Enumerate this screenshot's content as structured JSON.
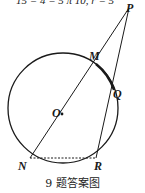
{
  "header": {
    "clipped_text": "15 = 4 = 5 π 10, r = 5"
  },
  "diagram": {
    "points": {
      "P": "P",
      "M": "M",
      "Q": "Q",
      "O": "O",
      "N": "N",
      "R": "R"
    },
    "segments": [
      "PN",
      "PR",
      "NR (dashed)",
      "MQ (arc, bold)"
    ],
    "shape": "circle with center O"
  },
  "caption": "9 题答案图"
}
